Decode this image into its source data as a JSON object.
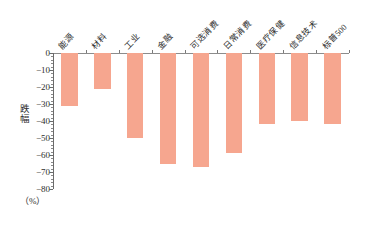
{
  "chart_data": {
    "type": "bar",
    "title": "",
    "subtitle": "",
    "xlabel": "",
    "ylabel": "跌幅",
    "unit_caption": "（%）",
    "ylim": [
      -80,
      0
    ],
    "ytick_step": 10,
    "yminor_step": 2,
    "grid": false,
    "legend": false,
    "bar_color": "#F6A68F",
    "axis_color": "#6b6b6b",
    "categories": [
      "能源",
      "材料",
      "工业",
      "金融",
      "可选消费",
      "日常消费",
      "医疗保健",
      "信息技术",
      "标普500"
    ],
    "values": [
      -31,
      -21,
      -50,
      -65,
      -67,
      -59,
      -42,
      -40,
      -42
    ],
    "ytick_labels": [
      "0",
      "−10",
      "−20",
      "−30",
      "−40",
      "−50",
      "−60",
      "−70",
      "−80"
    ],
    "ytick_values": [
      0,
      -10,
      -20,
      -30,
      -40,
      -50,
      -60,
      -70,
      -80
    ]
  }
}
